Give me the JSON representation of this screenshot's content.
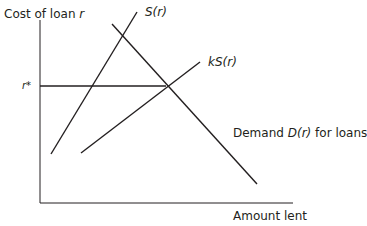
{
  "diagram": {
    "y_axis_label": {
      "text": "Cost of loan ",
      "var": "r"
    },
    "x_axis_label": "Amount lent",
    "equilibrium_label": "r*",
    "curves": [
      {
        "id": "supply",
        "label": "S(r)",
        "from": [
          51,
          154
        ],
        "to": [
          137,
          12
        ]
      },
      {
        "id": "scaled_supply",
        "label_k": "kS(r)",
        "from": [
          81,
          153
        ],
        "to": [
          200,
          62
        ]
      },
      {
        "id": "demand",
        "label_prefix": "Demand ",
        "label_var": "D(r)",
        "label_suffix": " for loans",
        "from": [
          112,
          24
        ],
        "to": [
          257,
          184
        ]
      }
    ],
    "equilibrium_line": {
      "y": 86,
      "from_x": 40,
      "to_x": 166
    },
    "line_color": "#231f20"
  }
}
